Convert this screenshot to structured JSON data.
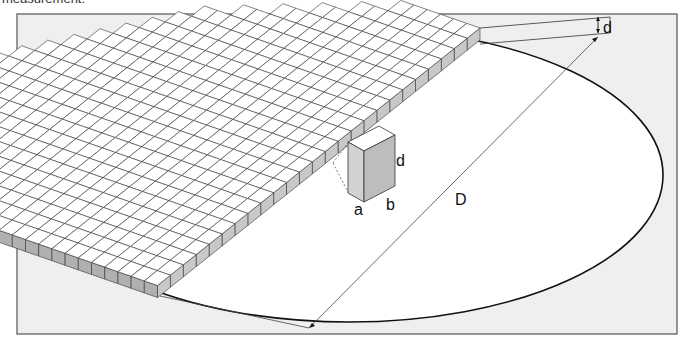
{
  "caption": "measurement.",
  "figure": {
    "frame": {
      "x": 17,
      "y": 14,
      "w": 660,
      "h": 320,
      "bg": "#efefef",
      "stroke": "#555555"
    },
    "wafer": {
      "cx": 349,
      "cy": 175,
      "rx": 314,
      "ry": 147,
      "fill": "#ffffff",
      "stroke": "#111111"
    },
    "die_colors": {
      "top": "#ffffff",
      "side": "#c8c8c8",
      "side_dark": "#b0b0b0",
      "edge": "#333333"
    },
    "grid": {
      "origin": [
        480,
        28
      ],
      "u": [
        -12.9,
        10.3
      ],
      "v": [
        -13.2,
        -4.6
      ],
      "height": 12,
      "rows": 25,
      "row_lengths": [
        6,
        8,
        10,
        12,
        14,
        16,
        17,
        18,
        19,
        20,
        21,
        22,
        23,
        24,
        24,
        25,
        25,
        26,
        26,
        27,
        27,
        26,
        24,
        22,
        20
      ]
    },
    "die_box": {
      "label_a": "a",
      "label_b": "b",
      "label_d": "d"
    },
    "labels": {
      "thickness": "d",
      "diameter": "D",
      "die_width": "a",
      "die_depth": "b",
      "die_height": "d"
    }
  }
}
